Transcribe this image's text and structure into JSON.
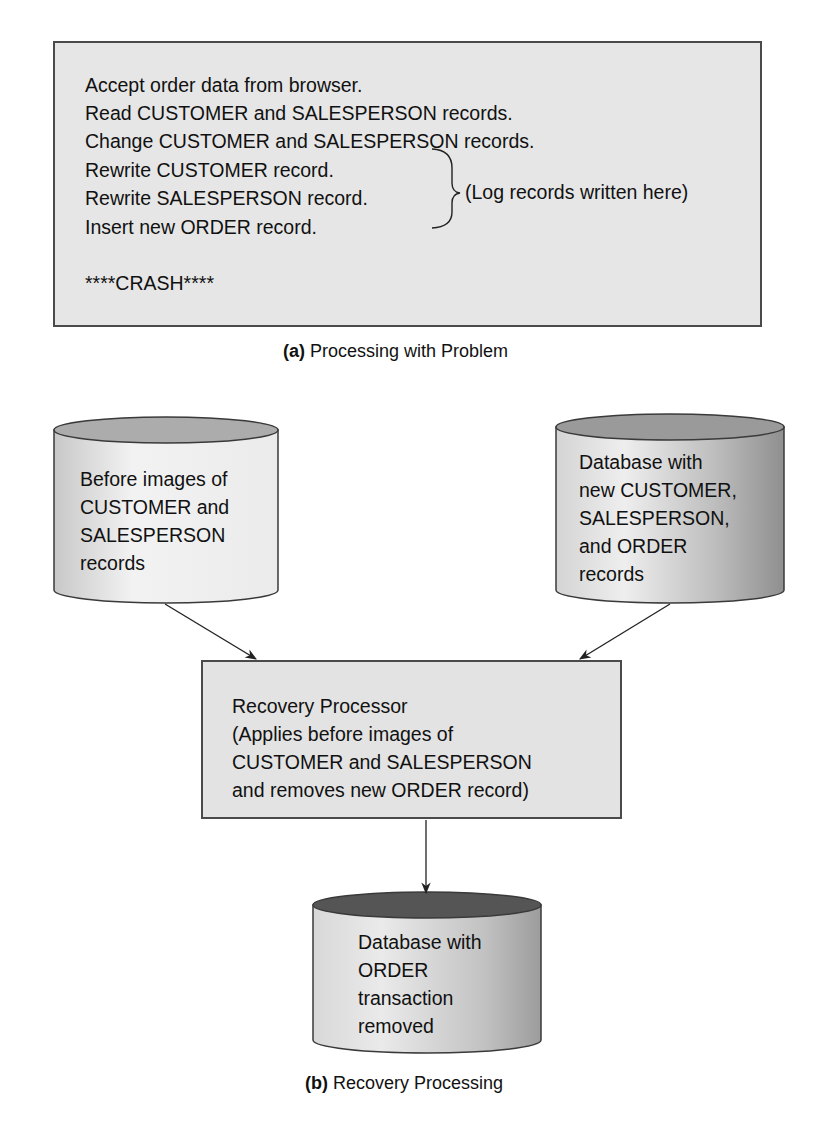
{
  "figure": {
    "part_a": {
      "caption_label": "(a)",
      "caption_text": "Processing with Problem",
      "steps": [
        "Accept order data from browser.",
        "Read CUSTOMER and SALESPERSON records.",
        "Change CUSTOMER and SALESPERSON records.",
        "Rewrite CUSTOMER record.",
        "Rewrite SALESPERSON record.",
        "Insert new ORDER record."
      ],
      "crash_text": "****CRASH****",
      "brace_annotation": "(Log records written here)"
    },
    "part_b": {
      "caption_label": "(b)",
      "caption_text": "Recovery Processing",
      "before_images_store": {
        "lines": [
          "Before images of",
          "CUSTOMER and",
          "SALESPERSON",
          "records"
        ]
      },
      "database_new": {
        "lines": [
          "Database with",
          "new CUSTOMER,",
          "SALESPERSON,",
          "and ORDER",
          "records"
        ]
      },
      "recovery_processor": {
        "lines": [
          "Recovery Processor",
          "(Applies before images of",
          "CUSTOMER and SALESPERSON",
          "and removes new ORDER record)"
        ]
      },
      "database_result": {
        "lines": [
          "Database with",
          "ORDER",
          "transaction",
          "removed"
        ]
      }
    },
    "colors": {
      "box_fill": "#e6e6e6",
      "border": "#4a4a4a",
      "cylinder_top_light": "#a8a8a8",
      "cylinder_top_dark": "#4e4e4e"
    }
  }
}
